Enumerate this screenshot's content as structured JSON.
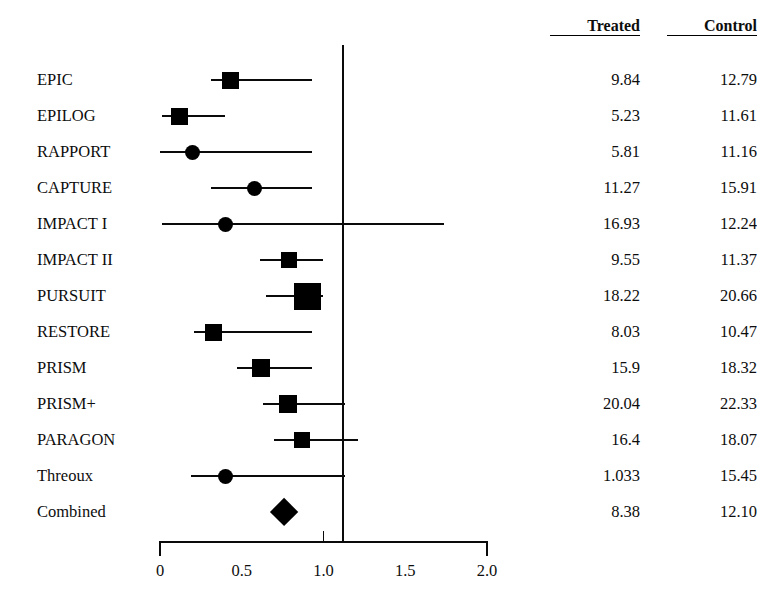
{
  "chart_data": {
    "type": "forest",
    "title": "",
    "xlabel": "",
    "ylabel": "",
    "xlim": [
      0,
      2.0
    ],
    "xticks": [
      0,
      0.5,
      1.0,
      1.5,
      2.0
    ],
    "xtick_labels": [
      "0",
      "0.5",
      "1.0",
      "1.5",
      "2.0"
    ],
    "null_line": 1.0,
    "grid": false,
    "legend": "none",
    "columns": [
      "Treated",
      "Control"
    ],
    "rows": [
      {
        "study": "EPIC",
        "estimate": 0.43,
        "ci_low": 0.31,
        "ci_high": 0.93,
        "marker": "square",
        "marker_size": 17,
        "treated": "9.84",
        "control": "12.79"
      },
      {
        "study": "EPILOG",
        "estimate": 0.12,
        "ci_low": 0.01,
        "ci_high": 0.4,
        "marker": "square",
        "marker_size": 17,
        "treated": "5.23",
        "control": "11.61"
      },
      {
        "study": "RAPPORT",
        "estimate": 0.2,
        "ci_low": 0.0,
        "ci_high": 0.93,
        "marker": "circle",
        "marker_size": 15,
        "treated": "5.81",
        "control": "11.16"
      },
      {
        "study": "CAPTURE",
        "estimate": 0.58,
        "ci_low": 0.31,
        "ci_high": 0.93,
        "marker": "circle",
        "marker_size": 15,
        "treated": "11.27",
        "control": "15.91"
      },
      {
        "study": "IMPACT I",
        "estimate": 0.4,
        "ci_low": 0.01,
        "ci_high": 1.74,
        "marker": "circle",
        "marker_size": 15,
        "treated": "16.93",
        "control": "12.24"
      },
      {
        "study": "IMPACT II",
        "estimate": 0.79,
        "ci_low": 0.61,
        "ci_high": 1.0,
        "marker": "square",
        "marker_size": 16,
        "treated": "9.55",
        "control": "11.37"
      },
      {
        "study": "PURSUIT",
        "estimate": 0.9,
        "ci_low": 0.65,
        "ci_high": 1.0,
        "marker": "square",
        "marker_size": 27,
        "treated": "18.22",
        "control": "20.66"
      },
      {
        "study": "RESTORE",
        "estimate": 0.33,
        "ci_low": 0.21,
        "ci_high": 0.93,
        "marker": "square",
        "marker_size": 17,
        "treated": "8.03",
        "control": "10.47"
      },
      {
        "study": "PRISM",
        "estimate": 0.62,
        "ci_low": 0.47,
        "ci_high": 0.93,
        "marker": "square",
        "marker_size": 18,
        "treated": "15.9",
        "control": "18.32"
      },
      {
        "study": "PRISM+",
        "estimate": 0.78,
        "ci_low": 0.63,
        "ci_high": 1.13,
        "marker": "square",
        "marker_size": 18,
        "treated": "20.04",
        "control": "22.33"
      },
      {
        "study": "PARAGON",
        "estimate": 0.87,
        "ci_low": 0.7,
        "ci_high": 1.21,
        "marker": "square",
        "marker_size": 16,
        "treated": "16.4",
        "control": "18.07"
      },
      {
        "study": "Threoux",
        "estimate": 0.4,
        "ci_low": 0.19,
        "ci_high": 1.13,
        "marker": "circle",
        "marker_size": 15,
        "treated": "1.033",
        "control": "15.45"
      },
      {
        "study": "Combined",
        "estimate": 0.76,
        "ci_low": 0.71,
        "ci_high": 0.81,
        "marker": "diamond",
        "marker_size": 28,
        "treated": "8.38",
        "control": "12.10"
      }
    ]
  },
  "colors": {
    "ink": "#000000",
    "background": "#ffffff"
  }
}
